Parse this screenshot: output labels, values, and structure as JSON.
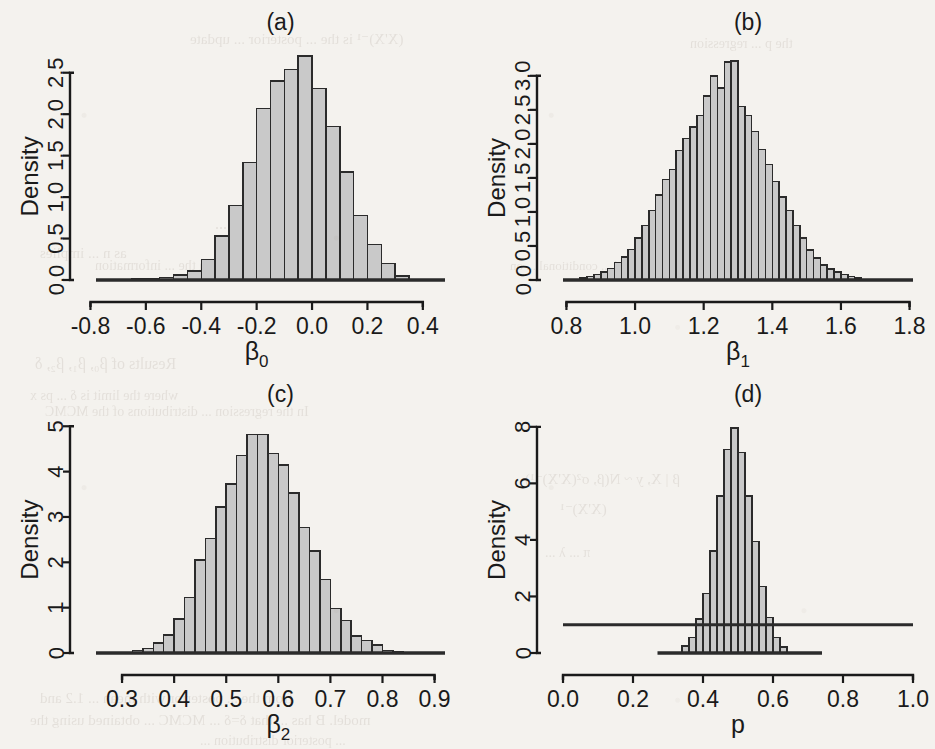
{
  "figure": {
    "layout": "2x2 grid of histograms",
    "panels": [
      "a",
      "b",
      "c",
      "d"
    ],
    "background_color": "#f4f2ee",
    "bar_fill_color": "#c9c9c9",
    "bar_stroke_color": "#2b2b2b",
    "axis_color": "#1a1a1a"
  },
  "chart_data": [
    {
      "type": "bar",
      "panel": "a",
      "title": "(a)",
      "xlabel": "β₀",
      "ylabel": "Density",
      "xlabel_base": "β",
      "xlabel_sub": "0",
      "xlim": [
        -0.78,
        0.48
      ],
      "ylim": [
        0,
        2.75
      ],
      "xticks": [
        -0.8,
        -0.6,
        -0.4,
        -0.2,
        0.0,
        0.2,
        0.4
      ],
      "xticklabels": [
        "-0.8",
        "-0.6",
        "-0.4",
        "-0.2",
        "0.0",
        "0.2",
        "0.4"
      ],
      "yticks": [
        0.0,
        0.5,
        1.0,
        1.5,
        2.0,
        2.5
      ],
      "yticklabels": [
        "0.0",
        "0.5",
        "1.0",
        "1.5",
        "2.0",
        "2.5"
      ],
      "bin_width": 0.05,
      "bin_starts": [
        -0.65,
        -0.6,
        -0.55,
        -0.5,
        -0.45,
        -0.4,
        -0.35,
        -0.3,
        -0.25,
        -0.2,
        -0.15,
        -0.1,
        -0.05,
        0.0,
        0.05,
        0.1,
        0.15,
        0.2,
        0.25,
        0.3
      ],
      "values": [
        0.01,
        0.02,
        0.03,
        0.06,
        0.11,
        0.25,
        0.53,
        0.9,
        1.42,
        2.07,
        2.4,
        2.54,
        2.7,
        2.31,
        1.85,
        1.3,
        0.78,
        0.43,
        0.2,
        0.05
      ],
      "grid": false,
      "reference_line": null
    },
    {
      "type": "bar",
      "panel": "b",
      "title": "(b)",
      "xlabel": "β₁",
      "ylabel": "Density",
      "xlabel_base": "β",
      "xlabel_sub": "1",
      "xlim": [
        0.79,
        1.81
      ],
      "ylim": [
        0,
        3.35
      ],
      "xticks": [
        0.8,
        1.0,
        1.2,
        1.4,
        1.6,
        1.8
      ],
      "xticklabels": [
        "0.8",
        "1.0",
        "1.2",
        "1.4",
        "1.6",
        "1.8"
      ],
      "yticks": [
        0.0,
        0.5,
        1.0,
        1.5,
        2.0,
        2.5,
        3.0
      ],
      "yticklabels": [
        "0.0",
        "0.5",
        "1.0",
        "1.5",
        "2.0",
        "2.5",
        "3.0"
      ],
      "bin_width": 0.02,
      "bin_starts": [
        0.84,
        0.86,
        0.88,
        0.9,
        0.92,
        0.94,
        0.96,
        0.98,
        1.0,
        1.02,
        1.04,
        1.06,
        1.08,
        1.1,
        1.12,
        1.14,
        1.16,
        1.18,
        1.2,
        1.22,
        1.24,
        1.26,
        1.28,
        1.3,
        1.32,
        1.34,
        1.36,
        1.38,
        1.4,
        1.42,
        1.44,
        1.46,
        1.48,
        1.5,
        1.52,
        1.54,
        1.56,
        1.58,
        1.6,
        1.62,
        1.64
      ],
      "values": [
        0.03,
        0.05,
        0.08,
        0.12,
        0.17,
        0.26,
        0.34,
        0.45,
        0.62,
        0.8,
        1.02,
        1.25,
        1.48,
        1.62,
        1.9,
        2.08,
        2.25,
        2.42,
        2.7,
        3.0,
        2.82,
        3.2,
        3.22,
        2.55,
        2.42,
        2.18,
        1.92,
        1.7,
        1.45,
        1.22,
        1.02,
        0.8,
        0.62,
        0.44,
        0.32,
        0.22,
        0.16,
        0.12,
        0.08,
        0.05,
        0.03
      ],
      "grid": false,
      "reference_line": null
    },
    {
      "type": "bar",
      "panel": "c",
      "title": "(c)",
      "xlabel": "β₂",
      "ylabel": "Density",
      "xlabel_base": "β",
      "xlabel_sub": "2",
      "xlim": [
        0.25,
        0.92
      ],
      "ylim": [
        0,
        5.05
      ],
      "xticks": [
        0.3,
        0.4,
        0.5,
        0.6,
        0.7,
        0.8,
        0.9
      ],
      "xticklabels": [
        "0.3",
        "0.4",
        "0.5",
        "0.6",
        "0.7",
        "0.8",
        "0.9"
      ],
      "yticks": [
        0,
        1,
        2,
        3,
        4,
        5
      ],
      "yticklabels": [
        "0",
        "1",
        "2",
        "3",
        "4",
        "5"
      ],
      "bin_width": 0.02,
      "bin_starts": [
        0.32,
        0.34,
        0.36,
        0.38,
        0.4,
        0.42,
        0.44,
        0.46,
        0.48,
        0.5,
        0.52,
        0.54,
        0.56,
        0.58,
        0.6,
        0.62,
        0.64,
        0.66,
        0.68,
        0.7,
        0.72,
        0.74,
        0.76,
        0.78,
        0.8,
        0.82
      ],
      "values": [
        0.05,
        0.1,
        0.22,
        0.4,
        0.75,
        1.22,
        2.05,
        2.52,
        3.22,
        3.73,
        4.35,
        4.82,
        4.82,
        4.4,
        4.15,
        3.53,
        2.77,
        2.25,
        1.62,
        0.98,
        0.72,
        0.38,
        0.28,
        0.18,
        0.06,
        0.03
      ],
      "grid": false,
      "reference_line": null
    },
    {
      "type": "bar",
      "panel": "d",
      "title": "(d)",
      "xlabel": "p",
      "ylabel": "Density",
      "xlabel_base": "p",
      "xlabel_sub": "",
      "xlim": [
        0.0,
        1.0
      ],
      "ylim": [
        0,
        8.1
      ],
      "xticks": [
        0.0,
        0.2,
        0.4,
        0.6,
        0.8,
        1.0
      ],
      "xticklabels": [
        "0.0",
        "0.2",
        "0.4",
        "0.6",
        "0.8",
        "1.0"
      ],
      "yticks": [
        0,
        2,
        4,
        6,
        8
      ],
      "yticklabels": [
        "0",
        "2",
        "4",
        "6",
        "8"
      ],
      "bin_width": 0.02,
      "bin_starts": [
        0.34,
        0.36,
        0.38,
        0.4,
        0.42,
        0.44,
        0.46,
        0.48,
        0.5,
        0.52,
        0.54,
        0.56,
        0.58,
        0.6,
        0.62
      ],
      "values": [
        0.25,
        0.55,
        1.2,
        2.1,
        3.6,
        5.55,
        7.2,
        7.95,
        7.1,
        5.55,
        3.95,
        2.35,
        1.25,
        0.55,
        0.22
      ],
      "baseline_span": [
        0.27,
        0.74
      ],
      "reference_line": {
        "y": 1.0,
        "label": "prior density = 1",
        "x_from": 0.0,
        "x_to": 1.0
      },
      "grid": false
    }
  ],
  "bleed_text": [
    {
      "t": "(X'X)⁻¹ is the ... posterior ... update",
      "x": 190,
      "y": 30,
      "s": 15
    },
    {
      "t": "the p ... regression",
      "x": 690,
      "y": 36,
      "s": 14
    },
    {
      "t": "C. ...",
      "x": 215,
      "y": 215,
      "s": 16
    },
    {
      "t": "as n ... implies",
      "x": 40,
      "y": 245,
      "s": 15
    },
    {
      "t": "distribution with the ... information",
      "x": 95,
      "y": 258,
      "s": 14
    },
    {
      "t": "and the ... computed ... conditional ... on",
      "x": 510,
      "y": 258,
      "s": 13
    },
    {
      "t": "Results of β₀, β₁, β₂, δ",
      "x": 35,
      "y": 355,
      "s": 16
    },
    {
      "t": "where the limit is δ ... ps x",
      "x": 30,
      "y": 388,
      "s": 14
    },
    {
      "t": "In the regression ... distributions of the MCMC",
      "x": 45,
      "y": 404,
      "s": 14
    },
    {
      "t": "β | X, y ~ N(β, σ²(X'X)⁻¹)",
      "x": 525,
      "y": 470,
      "s": 15
    },
    {
      "t": "(X'X)⁻¹",
      "x": 560,
      "y": 500,
      "s": 15
    },
    {
      "t": "π ... λ ...",
      "x": 545,
      "y": 545,
      "s": 14
    },
    {
      "t": "from the ... posterior with mean ... 1.2 and",
      "x": 40,
      "y": 690,
      "s": 15
    },
    {
      "t": "model. B has ... that δ=δ ... MCMC ... obtained using the",
      "x": 30,
      "y": 712,
      "s": 15
    },
    {
      "t": "... posterior distribution ...",
      "x": 200,
      "y": 733,
      "s": 14
    }
  ]
}
